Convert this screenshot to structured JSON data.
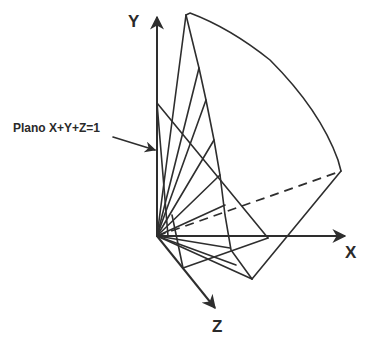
{
  "diagram": {
    "axes": {
      "x_label": "X",
      "y_label": "Y",
      "z_label": "Z"
    },
    "annotation": {
      "label": "Plano X+Y+Z=1"
    },
    "colors": {
      "line": "#2e2e2e",
      "background": "#ffffff"
    }
  }
}
